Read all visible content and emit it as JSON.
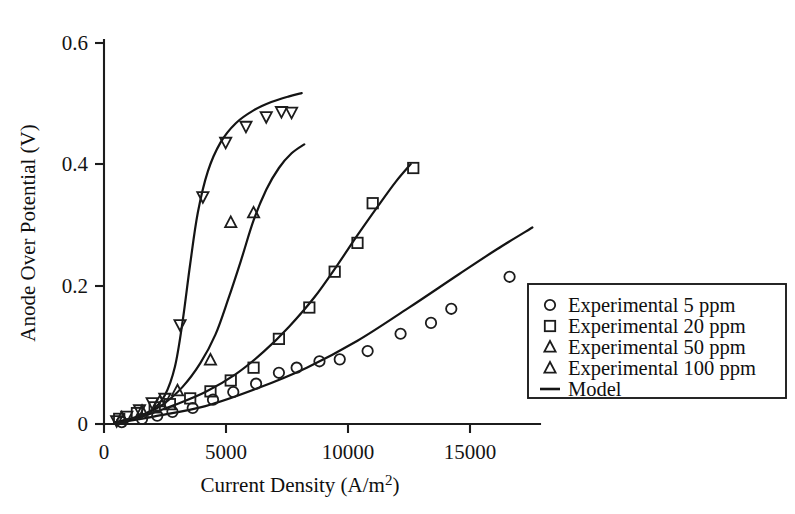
{
  "chart_data": {
    "type": "line",
    "title": "",
    "xlabel": "Current Density (A/m2)",
    "xlabel_main": "Current Density (A/m",
    "xlabel_sup": "2",
    "xlabel_tail": ")",
    "ylabel": "Anode Over Potential (V)",
    "xlim": [
      0,
      17200
    ],
    "ylim": [
      0,
      0.6
    ],
    "xticks": [
      0,
      5000,
      10000,
      15000
    ],
    "xticklabels": [
      "0",
      "5000",
      "10000",
      "15000"
    ],
    "yticks": [
      0,
      0.2,
      0.4,
      0.6
    ],
    "yticklabels": [
      "0",
      "0.2",
      "0.4",
      "0.6"
    ],
    "grid": false,
    "legend_position": "right-outside",
    "series": [
      {
        "name": "Experimental 5 ppm",
        "marker": "circle",
        "color": "#1c1c1c",
        "points": [
          [
            700,
            0.003
          ],
          [
            1500,
            0.008
          ],
          [
            2100,
            0.013
          ],
          [
            2700,
            0.019
          ],
          [
            3500,
            0.025
          ],
          [
            4300,
            0.038
          ],
          [
            5100,
            0.05
          ],
          [
            6000,
            0.063
          ],
          [
            6900,
            0.08
          ],
          [
            7600,
            0.088
          ],
          [
            8500,
            0.098
          ],
          [
            9300,
            0.101
          ],
          [
            10400,
            0.114
          ],
          [
            11700,
            0.141
          ],
          [
            12900,
            0.158
          ],
          [
            13700,
            0.18
          ],
          [
            16000,
            0.23
          ]
        ]
      },
      {
        "name": "Experimental 20 ppm",
        "marker": "square",
        "color": "#1c1c1c",
        "points": [
          [
            600,
            0.008
          ],
          [
            1300,
            0.017
          ],
          [
            2000,
            0.026
          ],
          [
            2600,
            0.031
          ],
          [
            3400,
            0.04
          ],
          [
            4200,
            0.051
          ],
          [
            5000,
            0.068
          ],
          [
            5900,
            0.088
          ],
          [
            6900,
            0.133
          ],
          [
            8100,
            0.182
          ],
          [
            9100,
            0.238
          ],
          [
            10000,
            0.283
          ],
          [
            10600,
            0.345
          ],
          [
            12200,
            0.4
          ]
        ]
      },
      {
        "name": "Experimental 50 ppm",
        "marker": "triangle-up",
        "color": "#1c1c1c",
        "points": [
          [
            700,
            0.01
          ],
          [
            1500,
            0.02
          ],
          [
            2200,
            0.035
          ],
          [
            2900,
            0.052
          ],
          [
            4200,
            0.1
          ],
          [
            5000,
            0.315
          ],
          [
            5900,
            0.33
          ]
        ]
      },
      {
        "name": "Experimental 100 ppm",
        "marker": "triangle-down",
        "color": "#1c1c1c",
        "points": [
          [
            500,
            0.005
          ],
          [
            900,
            0.012
          ],
          [
            1400,
            0.022
          ],
          [
            1900,
            0.033
          ],
          [
            2400,
            0.04
          ],
          [
            3000,
            0.155
          ],
          [
            3900,
            0.355
          ],
          [
            4800,
            0.44
          ],
          [
            5600,
            0.465
          ],
          [
            6400,
            0.48
          ],
          [
            7000,
            0.488
          ],
          [
            7400,
            0.487
          ]
        ]
      }
    ],
    "model_curves": [
      {
        "name": "Model 100 ppm",
        "points": [
          [
            400,
            0.002
          ],
          [
            1200,
            0.01
          ],
          [
            1900,
            0.022
          ],
          [
            2400,
            0.045
          ],
          [
            2800,
            0.09
          ],
          [
            3100,
            0.16
          ],
          [
            3400,
            0.25
          ],
          [
            3700,
            0.33
          ],
          [
            4100,
            0.395
          ],
          [
            4600,
            0.44
          ],
          [
            5200,
            0.47
          ],
          [
            5900,
            0.49
          ],
          [
            6600,
            0.503
          ],
          [
            7300,
            0.512
          ],
          [
            7800,
            0.517
          ]
        ]
      },
      {
        "name": "Model 50 ppm",
        "points": [
          [
            400,
            0.002
          ],
          [
            1400,
            0.012
          ],
          [
            2300,
            0.03
          ],
          [
            3100,
            0.058
          ],
          [
            3800,
            0.095
          ],
          [
            4400,
            0.14
          ],
          [
            4900,
            0.195
          ],
          [
            5400,
            0.255
          ],
          [
            5900,
            0.318
          ],
          [
            6400,
            0.366
          ],
          [
            6900,
            0.4
          ],
          [
            7400,
            0.423
          ],
          [
            7900,
            0.437
          ]
        ]
      },
      {
        "name": "Model 20 ppm",
        "points": [
          [
            400,
            0.002
          ],
          [
            1600,
            0.013
          ],
          [
            2800,
            0.03
          ],
          [
            4000,
            0.05
          ],
          [
            5200,
            0.078
          ],
          [
            6300,
            0.113
          ],
          [
            7300,
            0.152
          ],
          [
            8300,
            0.198
          ],
          [
            9200,
            0.248
          ],
          [
            10000,
            0.295
          ],
          [
            10800,
            0.34
          ],
          [
            11500,
            0.378
          ],
          [
            12100,
            0.406
          ]
        ]
      },
      {
        "name": "Model 5 ppm",
        "points": [
          [
            400,
            0.001
          ],
          [
            2000,
            0.012
          ],
          [
            4000,
            0.028
          ],
          [
            6000,
            0.055
          ],
          [
            8000,
            0.088
          ],
          [
            10000,
            0.13
          ],
          [
            12000,
            0.181
          ],
          [
            14000,
            0.234
          ],
          [
            15500,
            0.273
          ],
          [
            16900,
            0.307
          ]
        ]
      }
    ],
    "legend": {
      "entries": [
        {
          "label": "Experimental 5 ppm",
          "marker": "circle"
        },
        {
          "label": "Experimental 20 ppm",
          "marker": "square"
        },
        {
          "label": "Experimental 50 ppm",
          "marker": "triangle-up"
        },
        {
          "label": "Experimental 100 ppm",
          "marker": "triangle-up"
        },
        {
          "label": "Model",
          "marker": "line"
        }
      ]
    }
  }
}
